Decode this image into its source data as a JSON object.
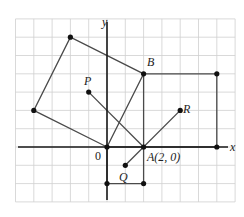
{
  "diagram": {
    "type": "coordinate-plane",
    "grid": {
      "x_min": -5,
      "x_max": 7,
      "y_min": -3,
      "y_max": 7,
      "color": "#cfcfcf"
    },
    "axes": {
      "x_label": "x",
      "y_label": "y",
      "origin_label": "0",
      "color": "#1a1a1a"
    },
    "points": [
      {
        "name": "O",
        "label": "",
        "x": 0,
        "y": 0
      },
      {
        "name": "A",
        "label": "A(2, 0)",
        "x": 2,
        "y": 0
      },
      {
        "name": "B",
        "label": "B",
        "x": 2,
        "y": 4
      },
      {
        "name": "P",
        "label": "P",
        "x": -1,
        "y": 3
      },
      {
        "name": "Q",
        "label": "Q",
        "x": 1,
        "y": -1
      },
      {
        "name": "R",
        "label": "R",
        "x": 4,
        "y": 2
      }
    ],
    "shapes": [
      {
        "name": "tilted-square",
        "vertices": [
          [
            0,
            0
          ],
          [
            2,
            4
          ],
          [
            -2,
            6
          ],
          [
            -4,
            2
          ]
        ]
      },
      {
        "name": "rectangle-right",
        "vertices": [
          [
            2,
            0
          ],
          [
            2,
            4
          ],
          [
            6,
            4
          ],
          [
            6,
            0
          ]
        ]
      },
      {
        "name": "square-below",
        "vertices": [
          [
            0,
            0
          ],
          [
            2,
            0
          ],
          [
            2,
            -2
          ],
          [
            0,
            -2
          ]
        ]
      }
    ],
    "segments": [
      {
        "name": "segment-PA",
        "from": [
          -1,
          3
        ],
        "to": [
          2,
          0
        ]
      },
      {
        "name": "segment-QR",
        "from": [
          1,
          -1
        ],
        "to": [
          4,
          2
        ]
      }
    ],
    "extra_vertices": [
      [
        -2,
        6
      ],
      [
        -4,
        2
      ],
      [
        6,
        4
      ],
      [
        6,
        0
      ],
      [
        0,
        -2
      ],
      [
        2,
        -2
      ]
    ],
    "labels": {
      "A": "A(2, 0)",
      "B": "B",
      "P": "P",
      "Q": "Q",
      "R": "R",
      "x": "x",
      "y": "y",
      "origin": "0"
    }
  }
}
